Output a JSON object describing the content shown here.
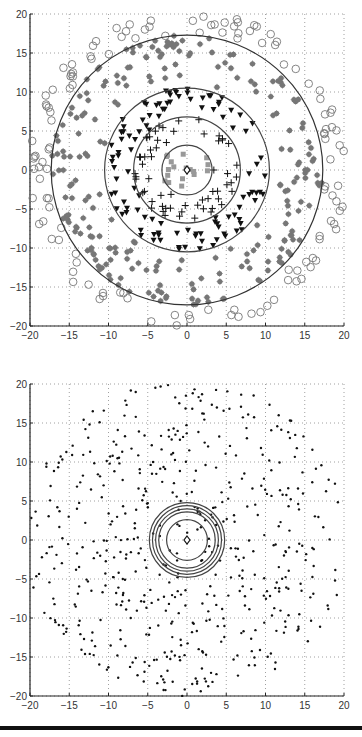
{
  "chart_data": [
    {
      "type": "scatter",
      "title": "",
      "xlabel": "",
      "ylabel": "",
      "xlim": [
        -20,
        20
      ],
      "ylim": [
        -20,
        20
      ],
      "xticks": [
        -20,
        -15,
        -10,
        -5,
        0,
        5,
        10,
        15,
        20
      ],
      "yticks": [
        -20,
        -15,
        -10,
        -5,
        0,
        5,
        10,
        15,
        20
      ],
      "grid": true,
      "legend": null,
      "center_marker": {
        "shape": "diamond",
        "x": 0,
        "y": 0
      },
      "rings": [
        {
          "radius": 3.2,
          "color": "#444444"
        },
        {
          "radius": 6.8,
          "color": "#444444"
        },
        {
          "radius": 10.5,
          "color": "#444444"
        },
        {
          "radius": 17.3,
          "color": "#333333"
        }
      ],
      "series": [
        {
          "name": "innermost (gray squares)",
          "marker": "square",
          "color": "#999999",
          "r_range": [
            0,
            3.2
          ],
          "count": 18
        },
        {
          "name": "second ring (plus)",
          "marker": "plus",
          "color": "#111111",
          "r_range": [
            3.2,
            6.8
          ],
          "count": 60
        },
        {
          "name": "third ring (triangles)",
          "marker": "triangle-down",
          "color": "#111111",
          "r_range": [
            6.8,
            10.5
          ],
          "count": 110
        },
        {
          "name": "fourth ring (stars)",
          "marker": "star",
          "color": "#777777",
          "r_range": [
            10.5,
            17.3
          ],
          "count": 230
        },
        {
          "name": "outer (circles)",
          "marker": "circle-open",
          "color": "#777777",
          "r_range": [
            17.3,
            20.5
          ],
          "count": 130
        }
      ]
    },
    {
      "type": "scatter",
      "title": "",
      "xlabel": "",
      "ylabel": "",
      "xlim": [
        -20,
        20
      ],
      "ylim": [
        -20,
        20
      ],
      "xticks": [
        -20,
        -15,
        -10,
        -5,
        0,
        5,
        10,
        15,
        20
      ],
      "yticks": [
        -20,
        -15,
        -10,
        -5,
        0,
        5,
        10,
        15,
        20
      ],
      "grid": true,
      "legend": null,
      "center_marker": {
        "shape": "diamond",
        "x": 0,
        "y": 0
      },
      "rings": [
        {
          "radius": 2.6,
          "color": "#444444"
        },
        {
          "radius": 3.6,
          "color": "#444444"
        },
        {
          "radius": 4.0,
          "color": "#444444"
        },
        {
          "radius": 4.4,
          "color": "#444444"
        },
        {
          "radius": 4.8,
          "color": "#444444"
        }
      ],
      "series": [
        {
          "name": "points (dots)",
          "marker": "dot",
          "color": "#111111",
          "r_range": [
            0,
            20.5
          ],
          "count": 540
        }
      ]
    }
  ],
  "plots": {
    "top": {
      "x_tick_labels": [
        "-20",
        "-15",
        "-10",
        "-5",
        "0",
        "5",
        "10",
        "15",
        "20"
      ],
      "y_tick_labels": [
        "20",
        "15",
        "10",
        "5",
        "0",
        "-5",
        "-10",
        "-15",
        "-20"
      ]
    },
    "bottom": {
      "x_tick_labels": [
        "-20",
        "-15",
        "-10",
        "-5",
        "0",
        "5",
        "10",
        "15",
        "20"
      ],
      "y_tick_labels": [
        "20",
        "15",
        "10",
        "5",
        "0",
        "-5",
        "-10",
        "-15",
        "-20"
      ]
    }
  }
}
